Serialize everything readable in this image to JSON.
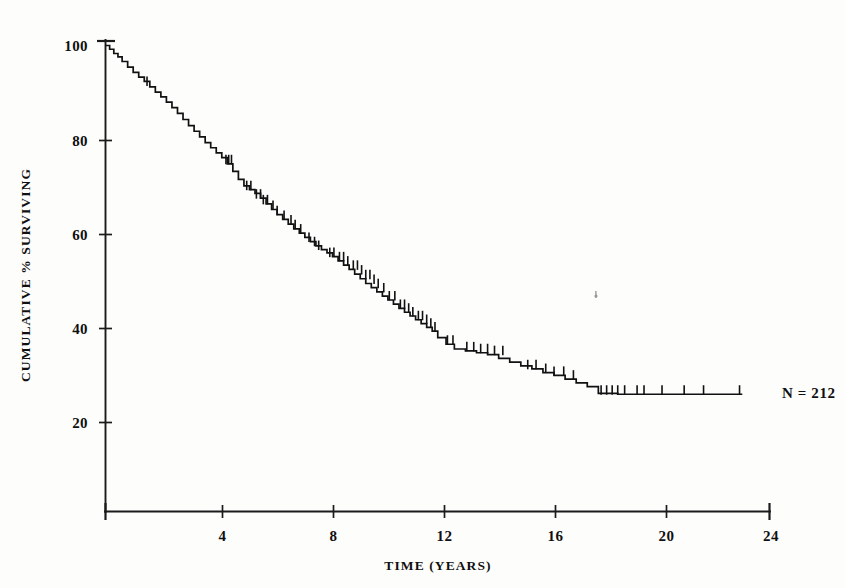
{
  "figure": {
    "background_color": "#fdfdfc",
    "ink_color": "#111111",
    "annotation": "N = 212"
  },
  "axes": {
    "x_title": "TIME (YEARS)",
    "y_title": "CUMULATIVE % SURVIVING",
    "x_tick_labels": [
      "4",
      "8",
      "12",
      "16",
      "20",
      "24"
    ],
    "y_tick_labels": [
      "100",
      "80",
      "60",
      "40",
      "20"
    ]
  },
  "chart_data": {
    "type": "line",
    "subtype": "kaplan-meier-survival-step",
    "title": "",
    "subtitle": "",
    "xlabel": "TIME (YEARS)",
    "ylabel": "CUMULATIVE % SURVIVING",
    "xlim": [
      0,
      24
    ],
    "ylim": [
      0,
      100
    ],
    "x_ticks": [
      4,
      8,
      12,
      16,
      20,
      24
    ],
    "y_ticks": [
      20,
      40,
      60,
      80,
      100
    ],
    "grid": false,
    "legend": null,
    "annotations": [
      {
        "text": "N = 212",
        "x": 23.2,
        "y": 26.0,
        "note": "sample size at right end of curve"
      }
    ],
    "series": [
      {
        "name": "Cumulative % surviving",
        "n_at_risk_start": 212,
        "x": [
          0.0,
          0.15,
          0.3,
          0.45,
          0.6,
          0.8,
          1.0,
          1.2,
          1.4,
          1.6,
          1.8,
          2.0,
          2.2,
          2.4,
          2.6,
          2.8,
          3.0,
          3.2,
          3.4,
          3.6,
          3.8,
          4.0,
          4.2,
          4.4,
          4.6,
          4.8,
          5.0,
          5.2,
          5.4,
          5.6,
          5.8,
          6.0,
          6.2,
          6.4,
          6.6,
          6.8,
          7.0,
          7.2,
          7.4,
          7.6,
          7.8,
          8.0,
          8.2,
          8.4,
          8.6,
          8.8,
          9.0,
          9.2,
          9.4,
          9.6,
          9.8,
          10.0,
          10.2,
          10.4,
          10.6,
          10.8,
          11.0,
          11.2,
          11.4,
          11.6,
          11.8,
          12.0,
          12.3,
          12.6,
          13.0,
          13.4,
          13.8,
          14.2,
          14.6,
          15.0,
          15.4,
          15.8,
          16.2,
          16.6,
          17.0,
          17.4,
          17.8,
          18.5,
          19.5,
          20.5,
          21.5,
          22.5,
          23.0
        ],
        "y": [
          100.0,
          99.2,
          98.3,
          97.6,
          96.6,
          95.4,
          94.3,
          93.3,
          92.4,
          91.2,
          90.1,
          89.1,
          88.0,
          86.8,
          85.6,
          84.3,
          83.0,
          81.8,
          80.6,
          79.4,
          78.3,
          77.2,
          76.2,
          74.9,
          73.3,
          71.6,
          70.2,
          69.4,
          68.6,
          67.6,
          66.4,
          65.2,
          64.1,
          63.1,
          62.1,
          61.1,
          60.2,
          59.3,
          58.4,
          57.5,
          56.7,
          56.0,
          55.2,
          54.3,
          53.4,
          52.5,
          51.5,
          50.5,
          49.5,
          48.6,
          47.7,
          46.8,
          46.0,
          45.1,
          44.2,
          43.4,
          42.6,
          41.8,
          41.0,
          40.2,
          39.4,
          38.0,
          36.6,
          35.6,
          35.2,
          34.8,
          34.4,
          33.6,
          32.8,
          32.0,
          31.4,
          30.6,
          30.0,
          29.2,
          28.4,
          27.6,
          26.2,
          26.0,
          26.0,
          26.0,
          26.0,
          26.0,
          26.0
        ],
        "censor_x": [
          1.5,
          4.35,
          4.45,
          4.55,
          5.1,
          5.25,
          5.45,
          5.6,
          5.7,
          5.85,
          6.05,
          6.2,
          6.45,
          6.7,
          6.85,
          7.05,
          7.35,
          7.55,
          7.7,
          8.1,
          8.25,
          8.45,
          8.6,
          8.75,
          8.95,
          9.1,
          9.25,
          9.4,
          9.55,
          9.7,
          9.85,
          10.05,
          10.25,
          10.45,
          10.65,
          10.8,
          10.95,
          11.1,
          11.3,
          11.45,
          11.6,
          11.75,
          11.9,
          12.35,
          12.55,
          13.05,
          13.3,
          13.55,
          13.8,
          14.05,
          14.35,
          15.25,
          15.55,
          15.9,
          16.2,
          16.55,
          16.9,
          17.9,
          18.1,
          18.3,
          18.5,
          18.75,
          19.2,
          19.45,
          20.1,
          20.9,
          21.6,
          22.9
        ],
        "censor_y": [
          91.5,
          74.9,
          74.9,
          74.9,
          69.4,
          69.4,
          67.6,
          67.6,
          66.4,
          66.4,
          65.2,
          64.1,
          63.1,
          62.1,
          61.1,
          60.2,
          58.4,
          57.5,
          56.7,
          55.2,
          55.2,
          54.3,
          54.3,
          53.4,
          52.5,
          52.5,
          51.5,
          50.5,
          50.5,
          49.5,
          48.6,
          47.7,
          46.0,
          46.0,
          44.2,
          44.2,
          43.4,
          42.6,
          41.8,
          41.8,
          41.0,
          40.2,
          39.4,
          36.6,
          36.6,
          35.2,
          35.2,
          34.8,
          34.8,
          34.4,
          34.4,
          31.4,
          31.4,
          30.6,
          30.0,
          30.0,
          29.2,
          26.0,
          26.0,
          26.0,
          26.0,
          26.0,
          26.0,
          26.0,
          26.0,
          26.0,
          26.0,
          26.0
        ]
      }
    ]
  }
}
